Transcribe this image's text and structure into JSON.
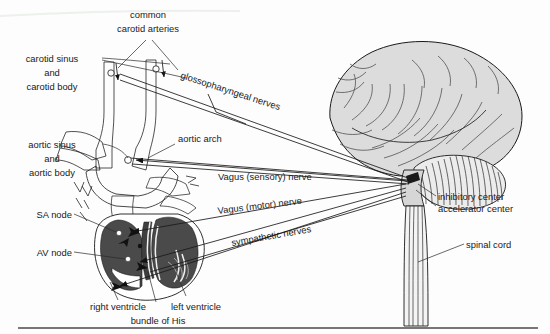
{
  "figure": {
    "background_color": "#fdfdfd",
    "rule_color": "#4a4a4a"
  },
  "palette": {
    "artery_fill": "#c9c9c9",
    "artery_fill_light": "#d8d8d8",
    "heart_muscle": "#4a4a4a",
    "heart_muscle_dark": "#3f3f3f",
    "brain_fill": "#dcdcdc",
    "brain_fill_shade": "#cfcfcf",
    "line": "#1a1a1a",
    "text": "#1a1a1a",
    "node_dot": "#ffffff"
  },
  "labels": {
    "common_carotid": {
      "lines": [
        "common",
        "carotid arteries"
      ],
      "line1": "common",
      "line2": "carotid arteries"
    },
    "carotid_sinus": {
      "lines": [
        "carotid sinus",
        "and",
        "carotid body"
      ],
      "line1": "carotid sinus",
      "line2": "and",
      "line3": "carotid body"
    },
    "aortic_sinus": {
      "lines": [
        "aortic sinus",
        "and",
        "aortic body"
      ],
      "line1": "aortic sinus",
      "line2": "and",
      "line3": "aortic body"
    },
    "aortic_arch": "aortic arch",
    "glossopharyngeal": "glossopharyngeal nerves",
    "vagus_sensory": "Vagus (sensory) nerve",
    "vagus_motor": "Vagus (motor) nerve",
    "sympathetic": "sympathetic nerves",
    "sa_node": "SA node",
    "av_node": "AV node",
    "right_ventricle": "right ventricle",
    "left_ventricle": "left ventricle",
    "bundle_of_his": "bundle of His",
    "inhibitory_center": "inhibitory center",
    "accelerator_center": "accelerator center",
    "spinal_cord": "spinal cord"
  }
}
